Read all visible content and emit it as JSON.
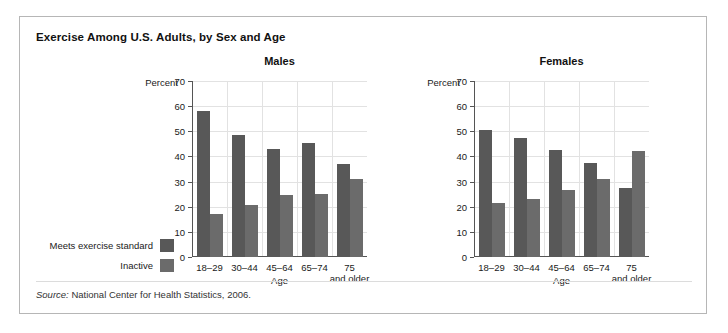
{
  "figure": {
    "title": "Exercise Among U.S. Adults, by Sex and Age",
    "source_prefix": "Source:",
    "source_text": " National Center for Health Statistics, 2006."
  },
  "legend": {
    "items": [
      {
        "label": "Meets exercise standard",
        "color": "#585858"
      },
      {
        "label": "Inactive",
        "color": "#6b6b6b"
      }
    ]
  },
  "axis": {
    "percent_label": "Percent",
    "age_label": "Age",
    "ticks": [
      "0",
      "10",
      "20",
      "30",
      "40",
      "50",
      "60",
      "70"
    ]
  },
  "categories": [
    {
      "line1": "18–29",
      "line2": ""
    },
    {
      "line1": "30–44",
      "line2": ""
    },
    {
      "line1": "45–64",
      "line2": ""
    },
    {
      "line1": "65–74",
      "line2": ""
    },
    {
      "line1": "75",
      "line2": "and older"
    }
  ],
  "chart_data": [
    {
      "type": "bar",
      "title": "Males",
      "categories": [
        "18–29",
        "30–44",
        "45–64",
        "65–74",
        "75 and older"
      ],
      "series": [
        {
          "name": "Meets exercise standard",
          "values": [
            58,
            48.5,
            43,
            45.5,
            37
          ],
          "color": "#585858"
        },
        {
          "name": "Inactive",
          "values": [
            17,
            20.5,
            24.5,
            25,
            31
          ],
          "color": "#6b6b6b"
        }
      ],
      "xlabel": "Age",
      "ylabel": "Percent",
      "ylim": [
        0,
        70
      ],
      "ytick_step": 10,
      "grid": true,
      "legend_position": "left-outside"
    },
    {
      "type": "bar",
      "title": "Females",
      "categories": [
        "18–29",
        "30–44",
        "45–64",
        "65–74",
        "75 and older"
      ],
      "series": [
        {
          "name": "Meets exercise standard",
          "values": [
            50.5,
            47.5,
            42.5,
            37.5,
            27.5
          ],
          "color": "#585858"
        },
        {
          "name": "Inactive",
          "values": [
            21.5,
            23,
            26.5,
            31,
            42
          ],
          "color": "#6b6b6b"
        }
      ],
      "xlabel": "Age",
      "ylabel": "Percent",
      "ylim": [
        0,
        70
      ],
      "ytick_step": 10,
      "grid": true,
      "legend_position": "left-outside"
    }
  ]
}
